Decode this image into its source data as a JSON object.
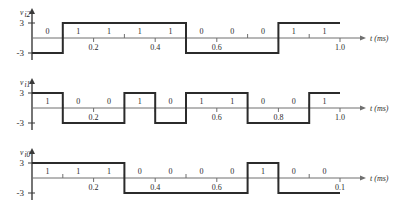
{
  "figure": {
    "title": "",
    "axis_unit_label": "t (ms)",
    "level_high_label": "3",
    "level_low_label": "-3",
    "bit_high": "1",
    "bit_low": "0"
  },
  "chart_data": {
    "type": "line",
    "title": "",
    "xlabel": "t (ms)",
    "ylabel": "",
    "xlim": [
      0,
      1.0
    ],
    "ylim": [
      -3,
      3
    ],
    "grid": false,
    "legend": "none",
    "bit_duration_ms": 0.1,
    "high_value": 3,
    "low_value": -3,
    "series": [
      {
        "name": "vi2",
        "label_base": "v",
        "label_sub": "i2",
        "bits": [
          "0",
          "1",
          "1",
          "1",
          "1",
          "0",
          "0",
          "0",
          "1",
          "1"
        ],
        "values": [
          -3,
          3,
          3,
          3,
          3,
          -3,
          -3,
          -3,
          3,
          3
        ],
        "x": [
          0.0,
          0.1,
          0.2,
          0.3,
          0.4,
          0.5,
          0.6,
          0.7,
          0.8,
          0.9
        ],
        "tick_labels": [
          {
            "x": 0.2,
            "text": "0.2"
          },
          {
            "x": 0.4,
            "text": "0.4"
          },
          {
            "x": 0.6,
            "text": "0.6"
          },
          {
            "x": 1.0,
            "text": "1.0"
          }
        ]
      },
      {
        "name": "vi1",
        "label_base": "v",
        "label_sub": "i1",
        "bits": [
          "1",
          "0",
          "0",
          "1",
          "0",
          "1",
          "1",
          "0",
          "0",
          "1"
        ],
        "values": [
          3,
          -3,
          -3,
          3,
          -3,
          3,
          3,
          -3,
          -3,
          3
        ],
        "x": [
          0.0,
          0.1,
          0.2,
          0.3,
          0.4,
          0.5,
          0.6,
          0.7,
          0.8,
          0.9
        ],
        "tick_labels": [
          {
            "x": 0.2,
            "text": "0.2"
          },
          {
            "x": 0.6,
            "text": "0.6"
          },
          {
            "x": 0.8,
            "text": "0.8"
          },
          {
            "x": 1.0,
            "text": "1.0"
          }
        ]
      },
      {
        "name": "vi0",
        "label_base": "v",
        "label_sub": "i0",
        "bits": [
          "1",
          "1",
          "1",
          "0",
          "0",
          "0",
          "0",
          "1",
          "0",
          "0"
        ],
        "values": [
          3,
          3,
          3,
          -3,
          -3,
          -3,
          -3,
          3,
          -3,
          -3
        ],
        "x": [
          0.0,
          0.1,
          0.2,
          0.3,
          0.4,
          0.5,
          0.6,
          0.7,
          0.8,
          0.9
        ],
        "tick_labels": [
          {
            "x": 0.2,
            "text": "0.2"
          },
          {
            "x": 0.4,
            "text": "0.4"
          },
          {
            "x": 0.6,
            "text": "0.6"
          },
          {
            "x": 1.0,
            "text": "0.1"
          }
        ]
      }
    ]
  }
}
